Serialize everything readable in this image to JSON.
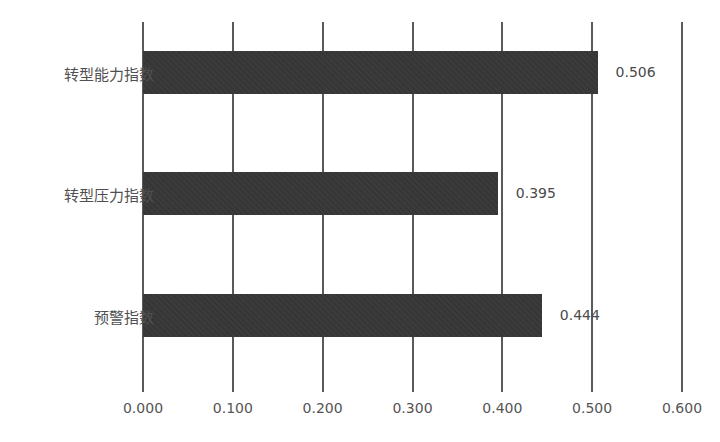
{
  "chart_data": {
    "type": "bar",
    "orientation": "horizontal",
    "title": "",
    "xlabel": "",
    "ylabel": "",
    "categories": [
      "转型能力指数",
      "转型压力指数",
      "预警指数"
    ],
    "values": [
      0.506,
      0.395,
      0.444
    ],
    "value_labels": [
      "0.506",
      "0.395",
      "0.444"
    ],
    "xlim": [
      0,
      0.6
    ],
    "x_ticks": [
      "0.000",
      "0.100",
      "0.200",
      "0.300",
      "0.400",
      "0.500",
      "0.600"
    ],
    "grid": "vertical",
    "legend": "none",
    "bar_color": "#3a3a3a"
  }
}
